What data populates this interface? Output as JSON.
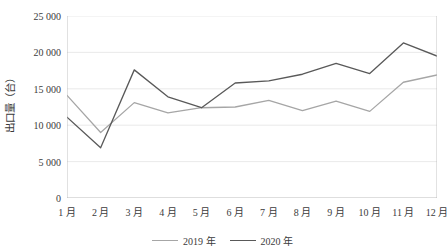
{
  "chart_data": {
    "type": "line",
    "title": "",
    "xlabel": "",
    "ylabel": "出口量（台）",
    "ylim": [
      0,
      25000
    ],
    "ytick_values": [
      0,
      5000,
      10000,
      15000,
      20000,
      25000
    ],
    "ytick_labels": [
      "0",
      "5 000",
      "10 000",
      "15 000",
      "20 000",
      "25 000"
    ],
    "grid": true,
    "legend_position": "bottom",
    "categories": [
      "1 月",
      "2 月",
      "3 月",
      "4 月",
      "5 月",
      "6 月",
      "7 月",
      "8 月",
      "9 月",
      "10 月",
      "11 月",
      "12 月"
    ],
    "series": [
      {
        "name": "2019 年",
        "color": "#a6a6a6",
        "values": [
          14100,
          9000,
          13100,
          11700,
          12400,
          12500,
          13400,
          12000,
          13300,
          11900,
          15900,
          16900
        ]
      },
      {
        "name": "2020 年",
        "color": "#595959",
        "values": [
          11100,
          6900,
          17600,
          13900,
          12400,
          15800,
          16100,
          17000,
          18500,
          17100,
          21300,
          19500
        ]
      }
    ]
  },
  "legend": {
    "items": [
      {
        "label": "2019 年",
        "color": "#a6a6a6"
      },
      {
        "label": "2020 年",
        "color": "#595959"
      }
    ]
  },
  "axis": {
    "y_title": "出口量（台）"
  },
  "colors": {
    "gridline": "#e4e4e4",
    "axis": "#b5b5b5",
    "text": "#3b3b3b",
    "series_2019": "#a6a6a6",
    "series_2020": "#595959"
  }
}
